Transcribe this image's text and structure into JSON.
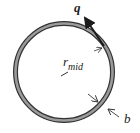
{
  "diagram": {
    "title": "",
    "shape": "thin-walled circular tube cross-section",
    "labels": {
      "shear_flow": "q",
      "radius_main": "r",
      "radius_sub": "mid",
      "thickness": "b"
    },
    "colors": {
      "ring_fill": "#9a9a9a",
      "ring_border": "#333333",
      "arrow": "#1a1a1a"
    }
  }
}
